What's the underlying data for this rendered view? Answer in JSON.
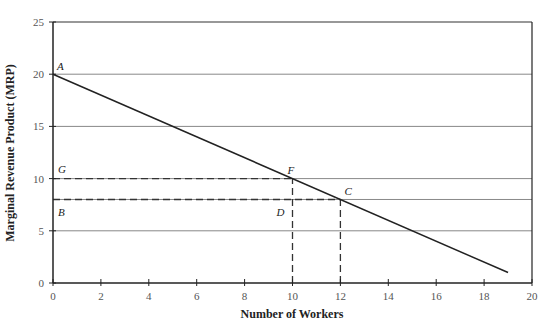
{
  "chart_data": {
    "type": "line",
    "title": "",
    "xlabel": "Number of Workers",
    "ylabel": "Marginal Revenue Product (MRP)",
    "xlim": [
      0,
      20
    ],
    "ylim": [
      0,
      25
    ],
    "x_ticks": [
      0,
      2,
      4,
      6,
      8,
      10,
      12,
      14,
      16,
      18,
      20
    ],
    "y_ticks": [
      0,
      5,
      10,
      15,
      20,
      25
    ],
    "grid": "horizontal",
    "series": [
      {
        "name": "MRP",
        "x": [
          0,
          19
        ],
        "y": [
          20,
          1
        ]
      }
    ],
    "reference_lines": [
      {
        "type": "horizontal-dashed",
        "y": 10,
        "x_from": 0,
        "x_to": 10
      },
      {
        "type": "horizontal-dashed",
        "y": 8,
        "x_from": 0,
        "x_to": 12
      },
      {
        "type": "vertical-dashed",
        "x": 10,
        "y_from": 0,
        "y_to": 10
      },
      {
        "type": "vertical-dashed",
        "x": 12,
        "y_from": 0,
        "y_to": 8
      }
    ],
    "annotations": [
      {
        "label": "A",
        "x": 0,
        "y": 20
      },
      {
        "label": "G",
        "x": 0,
        "y": 10
      },
      {
        "label": "B",
        "x": 0,
        "y": 8
      },
      {
        "label": "F",
        "x": 10,
        "y": 10
      },
      {
        "label": "C",
        "x": 12,
        "y": 8
      },
      {
        "label": "D",
        "x": 10,
        "y": 8
      }
    ]
  }
}
